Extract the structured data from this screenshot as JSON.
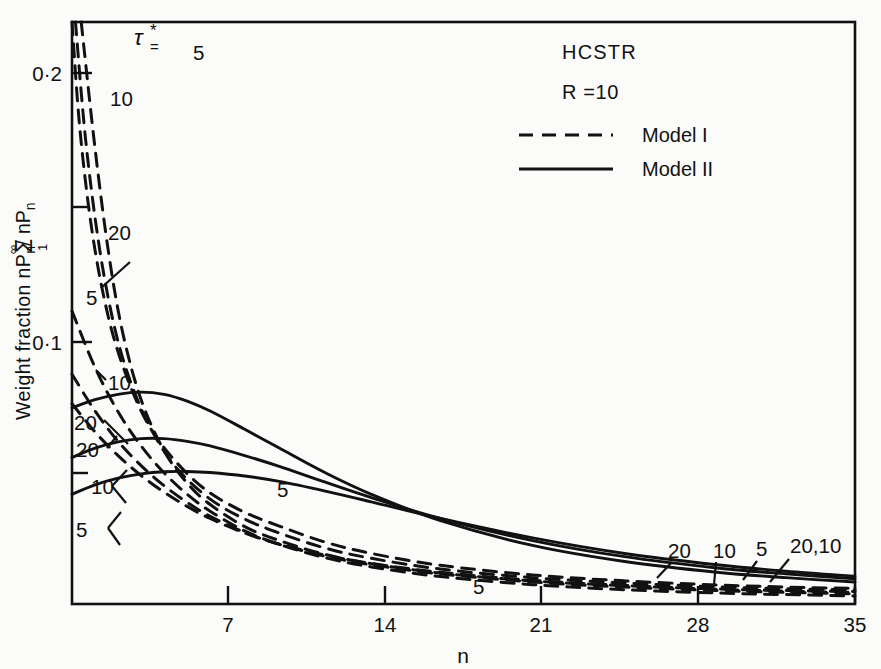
{
  "figure": {
    "annotations": {
      "system_label": "HCSTR",
      "ratio_label": "R =10",
      "tau_symbol": "τ",
      "tau_star": "*",
      "tau_equals": "=",
      "tau_full": "τ*="
    },
    "legend": {
      "position": "top-right-inside",
      "entries": [
        {
          "label": "Model I",
          "style": "dashed",
          "dash": "14,9"
        },
        {
          "label": "Model II",
          "style": "solid",
          "dash": "none"
        }
      ]
    },
    "axes": {
      "x": {
        "label": "n",
        "ticks": [
          7,
          14,
          21,
          28,
          35
        ],
        "tick_labels": [
          "7",
          "14",
          "21",
          "28",
          "35"
        ],
        "min": 1,
        "max": 35
      },
      "y": {
        "label_parts": [
          "Weight fraction  nP",
          "n",
          "/",
          "Σ",
          "∞",
          "1",
          "nP",
          "n"
        ],
        "label_plain": "Weight fraction nPn / Σ 1..∞ nPn",
        "major_ticks": [
          0.1,
          0.2
        ],
        "major_tick_labels": [
          "0·0·1",
          "0·2"
        ],
        "tick_label_01": "0·1",
        "tick_label_02": "0·2",
        "minor_ticks": [
          0.05,
          0.15
        ],
        "min": 0,
        "max": 0.2165
      }
    },
    "curve_labels": {
      "left_dashed": [
        "5",
        "10",
        "20",
        "5",
        "10",
        "20"
      ],
      "left_solid": [
        "5",
        "10",
        "20"
      ],
      "inline": [
        "5",
        "5"
      ],
      "right": [
        "20",
        "10",
        "5",
        "20,10"
      ]
    },
    "colors": {
      "ink": "#111111",
      "paper": "#fbfbfa"
    }
  },
  "chart_data": {
    "type": "line",
    "title": "",
    "subtitle": "",
    "xlabel": "n",
    "ylabel": "Weight fraction nPn / Σ 1..∞ nPn",
    "xlim": [
      1,
      35
    ],
    "ylim": [
      0,
      0.2165
    ],
    "grid": false,
    "legend_position": "upper right inside",
    "annotations": [
      "HCSTR",
      "R =10",
      "τ*="
    ],
    "series": [
      {
        "name": "Model I, τ* = 5",
        "model": "Model I",
        "tau_star": 5,
        "style": "dashed",
        "x": [
          1.4,
          2,
          2.6,
          3.2,
          4,
          5,
          6,
          7,
          8.5,
          10,
          12,
          14,
          17,
          21,
          25,
          29,
          32,
          35
        ],
        "y": [
          0.2165,
          0.1695,
          0.13,
          0.101,
          0.076,
          0.057,
          0.045,
          0.037,
          0.0288,
          0.0236,
          0.0184,
          0.015,
          0.0115,
          0.0086,
          0.0068,
          0.0056,
          0.005,
          0.0046
        ]
      },
      {
        "name": "Model I, τ* = 10",
        "model": "Model I",
        "tau_star": 10,
        "style": "dashed",
        "x": [
          1.15,
          1.6,
          2.2,
          2.9,
          3.7,
          4.6,
          5.6,
          7,
          8.5,
          10,
          12,
          14,
          17,
          21,
          25,
          29,
          32,
          35
        ],
        "y": [
          0.2165,
          0.172,
          0.132,
          0.101,
          0.079,
          0.0625,
          0.05,
          0.039,
          0.0316,
          0.0264,
          0.0208,
          0.017,
          0.013,
          0.0098,
          0.0078,
          0.0064,
          0.0057,
          0.0052
        ]
      },
      {
        "name": "Model I, τ* = 20",
        "model": "Model I",
        "tau_star": 20,
        "style": "dashed",
        "x": [
          1.0,
          1.35,
          1.9,
          2.6,
          3.4,
          4.3,
          5.4,
          6.8,
          8.4,
          10,
          12,
          14,
          17,
          21,
          25,
          29,
          32,
          35
        ],
        "y": [
          0.2165,
          0.176,
          0.137,
          0.106,
          0.084,
          0.067,
          0.054,
          0.0425,
          0.0345,
          0.029,
          0.023,
          0.0188,
          0.0144,
          0.0108,
          0.0086,
          0.0071,
          0.0063,
          0.0058
        ]
      },
      {
        "name": "Model I lower, τ* = 5",
        "model": "Model I",
        "tau_star": 5,
        "style": "dashed",
        "x": [
          1,
          2,
          3,
          4,
          5,
          6,
          7,
          8.5,
          10,
          12,
          14,
          17,
          21,
          25,
          29,
          32,
          35
        ],
        "y": [
          0.109,
          0.088,
          0.0715,
          0.0588,
          0.0488,
          0.0408,
          0.0345,
          0.0272,
          0.0222,
          0.0172,
          0.0138,
          0.0102,
          0.0072,
          0.0053,
          0.0041,
          0.0035,
          0.003
        ]
      },
      {
        "name": "Model I lower, τ* = 10",
        "model": "Model I",
        "tau_star": 10,
        "style": "dashed",
        "x": [
          1,
          2,
          3,
          4,
          5,
          6,
          7,
          8.5,
          10,
          12,
          14,
          17,
          21,
          25,
          29,
          32,
          35
        ],
        "y": [
          0.0855,
          0.0718,
          0.0605,
          0.0515,
          0.044,
          0.0378,
          0.0326,
          0.0266,
          0.0222,
          0.0178,
          0.0146,
          0.0112,
          0.0082,
          0.0063,
          0.005,
          0.0043,
          0.0038
        ]
      },
      {
        "name": "Model I lower, τ* = 20",
        "model": "Model I",
        "tau_star": 20,
        "style": "dashed",
        "x": [
          1,
          2,
          3,
          4,
          5,
          6,
          7,
          8.5,
          10,
          12,
          14,
          17,
          21,
          25,
          29,
          32,
          35
        ],
        "y": [
          0.0745,
          0.064,
          0.0552,
          0.0478,
          0.0416,
          0.0363,
          0.0318,
          0.0264,
          0.0223,
          0.0182,
          0.0151,
          0.0118,
          0.0088,
          0.0069,
          0.0055,
          0.0048,
          0.0043
        ]
      },
      {
        "name": "Model II, τ* = 5",
        "model": "Model II",
        "tau_star": 5,
        "style": "solid",
        "x": [
          1,
          2,
          3,
          4,
          5,
          6,
          7,
          8.5,
          10,
          12,
          14,
          17,
          21,
          25,
          29,
          32,
          35
        ],
        "y": [
          0.073,
          0.076,
          0.078,
          0.0788,
          0.078,
          0.0755,
          0.0718,
          0.065,
          0.058,
          0.0488,
          0.0408,
          0.031,
          0.0218,
          0.0158,
          0.0118,
          0.0098,
          0.0082
        ]
      },
      {
        "name": "Model II, τ* = 10",
        "model": "Model II",
        "tau_star": 10,
        "style": "solid",
        "x": [
          1,
          2,
          3,
          4,
          5,
          6,
          7,
          8.5,
          10,
          12,
          14,
          17,
          21,
          25,
          29,
          32,
          35
        ],
        "y": [
          0.0545,
          0.058,
          0.0603,
          0.0615,
          0.0615,
          0.0605,
          0.0588,
          0.0552,
          0.0512,
          0.0453,
          0.0396,
          0.0318,
          0.0236,
          0.0176,
          0.0134,
          0.0112,
          0.0094
        ]
      },
      {
        "name": "Model II, τ* = 20",
        "model": "Model II",
        "tau_star": 20,
        "style": "solid",
        "x": [
          1,
          2,
          3,
          4,
          5,
          6,
          7,
          8.5,
          10,
          12,
          14,
          17,
          21,
          25,
          29,
          32,
          35
        ],
        "y": [
          0.0408,
          0.0443,
          0.0468,
          0.0484,
          0.0492,
          0.0493,
          0.0489,
          0.0476,
          0.0456,
          0.042,
          0.038,
          0.0318,
          0.0246,
          0.0188,
          0.0146,
          0.0122,
          0.0103
        ]
      }
    ]
  }
}
